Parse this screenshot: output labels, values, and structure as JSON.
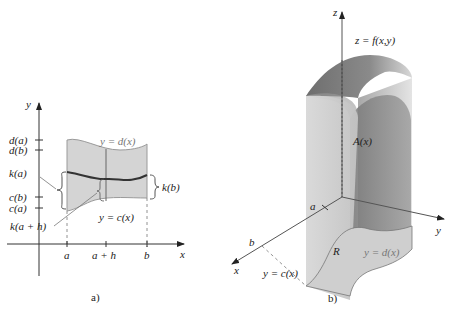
{
  "figure_a": {
    "caption": "a)",
    "axis_y_label": "y",
    "axis_x_label": "x",
    "y_ticks": [
      "d(a)",
      "d(b)",
      "k(a)",
      "c(b)",
      "c(a)"
    ],
    "x_ticks": [
      "a",
      "a + h",
      "b"
    ],
    "upper_curve_label": "y = d(x)",
    "lower_curve_label": "y = c(x)",
    "right_brace_label": "k(b)",
    "lower_callout_label": "k(a + h)"
  },
  "figure_b": {
    "caption": "b)",
    "axis_z_label": "z",
    "axis_y_label": "y",
    "axis_x_label": "x",
    "surface_label": "z = f(x,y)",
    "cross_section_label": "A(x)",
    "region_label": "R",
    "x_tick_a": "a",
    "x_tick_b": "b",
    "upper_boundary_label": "y = d(x)",
    "lower_boundary_label": "y = c(x)"
  },
  "colors": {
    "region_fill": "#d4d4d4",
    "curve_stroke": "#8a8a8a",
    "k_curve": "#333333",
    "axis": "#333333",
    "label_gray": "#777777"
  }
}
